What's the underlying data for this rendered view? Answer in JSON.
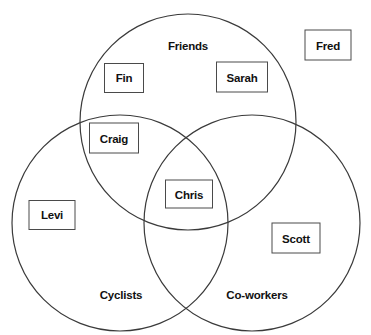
{
  "diagram": {
    "type": "venn-3-set",
    "background_color": "#ffffff",
    "stroke_color": "#3a3a3a",
    "text_color": "#111111",
    "box_border_color": "#4a4a4a",
    "sets": [
      {
        "id": "friends",
        "label": "Friends",
        "cx": 188,
        "cy": 122,
        "r": 108,
        "label_x": 188,
        "label_y": 46
      },
      {
        "id": "cyclists",
        "label": "Cyclists",
        "cx": 120,
        "cy": 223,
        "r": 108,
        "label_x": 121,
        "label_y": 295
      },
      {
        "id": "coworkers",
        "label": "Co-workers",
        "cx": 252,
        "cy": 223,
        "r": 108,
        "label_x": 257,
        "label_y": 295
      }
    ],
    "members": [
      {
        "id": "fin",
        "label": "Fin",
        "region": "friends",
        "x": 124,
        "y": 78,
        "w": 40,
        "h": 30
      },
      {
        "id": "sarah",
        "label": "Sarah",
        "region": "friends",
        "x": 242,
        "y": 77,
        "w": 52,
        "h": 31
      },
      {
        "id": "fred",
        "label": "Fred",
        "region": "outside",
        "x": 328,
        "y": 45,
        "w": 47,
        "h": 31
      },
      {
        "id": "craig",
        "label": "Craig",
        "region": "friends-cyclists",
        "x": 114,
        "y": 138,
        "w": 50,
        "h": 31
      },
      {
        "id": "chris",
        "label": "Chris",
        "region": "friends-cyclists-coworkers",
        "x": 189,
        "y": 194,
        "w": 48,
        "h": 29
      },
      {
        "id": "levi",
        "label": "Levi",
        "region": "cyclists",
        "x": 52,
        "y": 215,
        "w": 47,
        "h": 30
      },
      {
        "id": "scott",
        "label": "Scott",
        "region": "coworkers",
        "x": 296,
        "y": 238,
        "w": 49,
        "h": 31
      }
    ]
  }
}
